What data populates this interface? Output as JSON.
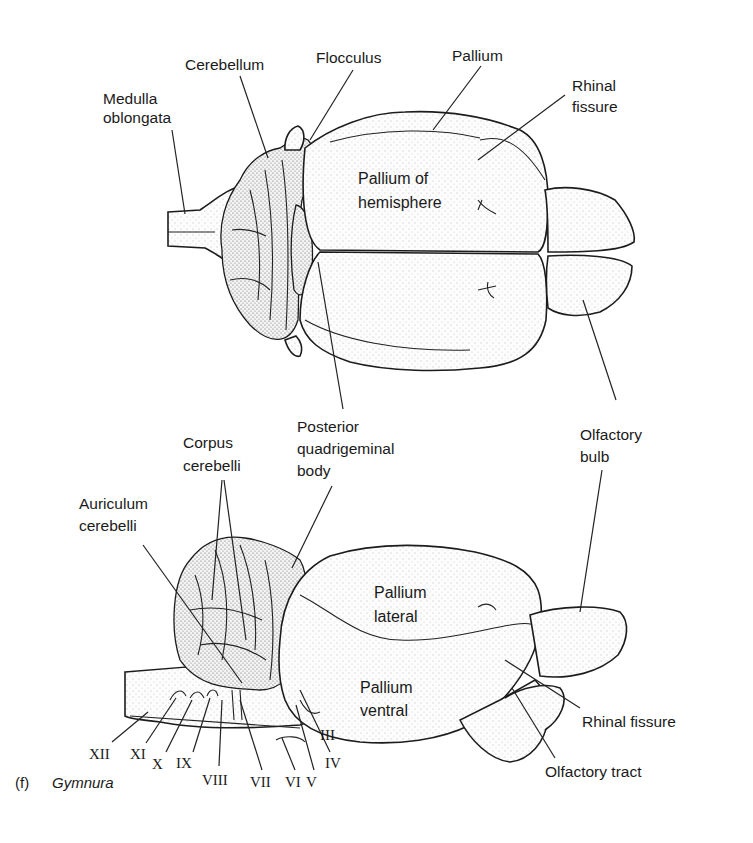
{
  "figure": {
    "caption_letter": "(f)",
    "caption_genus": "Gymnura"
  },
  "dorsal_view": {
    "labels": {
      "medulla": [
        "Medulla",
        "oblongata"
      ],
      "cerebellum": "Cerebellum",
      "flocculus": "Flocculus",
      "pallium": "Pallium",
      "rhinal_fissure": [
        "Rhinal",
        "fissure"
      ],
      "pallium_of_hemisphere": [
        "Pallium of",
        "hemisphere"
      ],
      "posterior_quadrigeminal": [
        "Posterior",
        "quadrigeminal",
        "body"
      ],
      "olfactory_bulb": [
        "Olfactory",
        "bulb"
      ]
    }
  },
  "lateral_view": {
    "labels": {
      "corpus_cerebelli": [
        "Corpus",
        "cerebelli"
      ],
      "auriculum_cerebelli": [
        "Auriculum",
        "cerebelli"
      ],
      "pallium_lateral": [
        "Pallium",
        "lateral"
      ],
      "pallium_ventral": [
        "Pallium",
        "ventral"
      ],
      "rhinal_fissure": "Rhinal fissure",
      "olfactory_tract": "Olfactory tract"
    },
    "cranial_nerves": [
      "XII",
      "XI",
      "X",
      "IX",
      "VIII",
      "VII",
      "VI",
      "V",
      "IV",
      "III"
    ]
  }
}
